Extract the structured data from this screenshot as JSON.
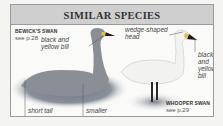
{
  "title": "SIMILAR SPECIES",
  "left_bird": {
    "name": "BEWICK'S SWAN",
    "ref": "see p.28",
    "notes": {
      "bill": "black and yellow bill",
      "bill_line1": "black and",
      "bill_line2": "yellow bill",
      "tail": "short tail",
      "size": "smaller"
    }
  },
  "right_bird": {
    "name": "WHOOPER SWAN",
    "ref": "see p.29",
    "notes": {
      "head_line1": "wedge-shaped",
      "head_line2": "head",
      "bill_line1": "black",
      "bill_line2": "and",
      "bill_line3": "yellow",
      "bill_line4": "bill"
    }
  }
}
